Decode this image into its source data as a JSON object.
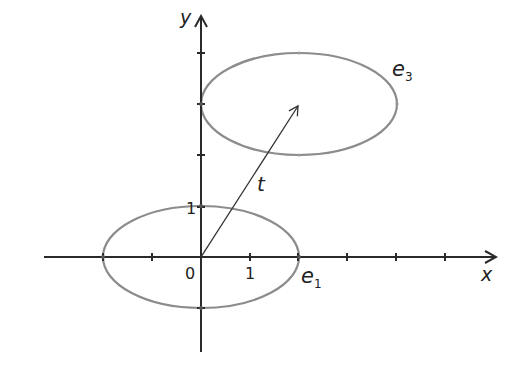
{
  "diagram": {
    "axes": {
      "x_label": "x",
      "y_label": "y",
      "origin_label": "0",
      "x_unit_label": "1",
      "y_unit_label": "1"
    },
    "ellipses": [
      {
        "name": "e1",
        "label_main": "e",
        "label_sub": "1",
        "center": [
          0,
          0
        ],
        "semi_axis_x": 2,
        "semi_axis_y": 1
      },
      {
        "name": "e3",
        "label_main": "e",
        "label_sub": "3",
        "center": [
          2,
          3
        ],
        "semi_axis_x": 2,
        "semi_axis_y": 1
      }
    ],
    "vector": {
      "label": "t",
      "from": [
        0,
        0
      ],
      "to": [
        2,
        3
      ]
    },
    "colors": {
      "axis": "#2a2a2a",
      "ellipse": "#8c8c8c",
      "vector": "#333333"
    }
  }
}
